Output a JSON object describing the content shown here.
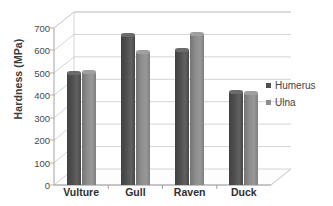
{
  "chart_data": {
    "type": "bar",
    "title": "",
    "xlabel": "",
    "ylabel": "Hardness (MPa)",
    "categories": [
      "Vulture",
      "Gull",
      "Raven",
      "Duck"
    ],
    "series": [
      {
        "name": "Humerus",
        "color": "#4f4f4f",
        "values": [
          500,
          670,
          600,
          415
        ]
      },
      {
        "name": "Ulna",
        "color": "#8d8d8d",
        "values": [
          505,
          595,
          675,
          412
        ]
      }
    ],
    "ylim": [
      0,
      700
    ],
    "ytick_values": [
      0,
      100,
      200,
      300,
      400,
      500,
      600,
      700
    ],
    "ytick_labels": [
      "0",
      "100",
      "200",
      "300",
      "400",
      "500",
      "600",
      "700"
    ],
    "grid": true,
    "legend_position": "right",
    "style": "3d-column"
  },
  "axis": {
    "y_title": "Hardness (MPa)",
    "y_ticks": [
      "700",
      "600",
      "500",
      "400",
      "300",
      "200",
      "100",
      "0"
    ]
  },
  "legend": {
    "items": [
      {
        "label": "Humerus",
        "color": "#4f4f4f"
      },
      {
        "label": "Ulna",
        "color": "#8d8d8d"
      }
    ]
  },
  "colors": {
    "humerus": "#4f4f4f",
    "ulna": "#8d8d8d",
    "gridline": "#c9c9c9",
    "axis": "#9a9a9a",
    "background": "#ffffff",
    "text": "#3f3f3f"
  }
}
